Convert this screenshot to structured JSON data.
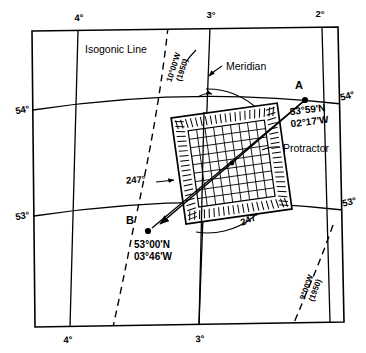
{
  "diagram": {
    "stroke_color": "#000000",
    "background_color": "#ffffff"
  },
  "graticule": {
    "longitude_labels_top": [
      "4°",
      "3°",
      "2°"
    ],
    "longitude_labels_bottom": [
      "4°",
      "3°"
    ],
    "latitude_labels_left": [
      "54°",
      "53°"
    ],
    "latitude_labels_right": [
      "54°",
      "53°"
    ]
  },
  "callouts": {
    "isogonic_line": "Isogonic Line",
    "meridian": "Meridian",
    "protractor": "Protractor"
  },
  "isogonic_lines": [
    {
      "id": "upper-left",
      "label_value": "10°00'W",
      "label_epoch": "(1950)"
    },
    {
      "id": "lower-right",
      "label_value": "9°00'W",
      "label_epoch": "(1950)"
    }
  ],
  "positions": [
    {
      "id": "A",
      "name": "A",
      "latitude": "53°59'N",
      "longitude": "02°17'W"
    },
    {
      "id": "B",
      "name": "B",
      "latitude": "53°00'N",
      "longitude": "03°46'W"
    }
  ],
  "bearings": [
    {
      "id": "bearing-course",
      "value": "247°"
    },
    {
      "id": "bearing-arc",
      "value": "247°"
    }
  ],
  "protractor": {
    "grid_rows": 9,
    "grid_cols": 9,
    "rotation_degrees": -8
  }
}
